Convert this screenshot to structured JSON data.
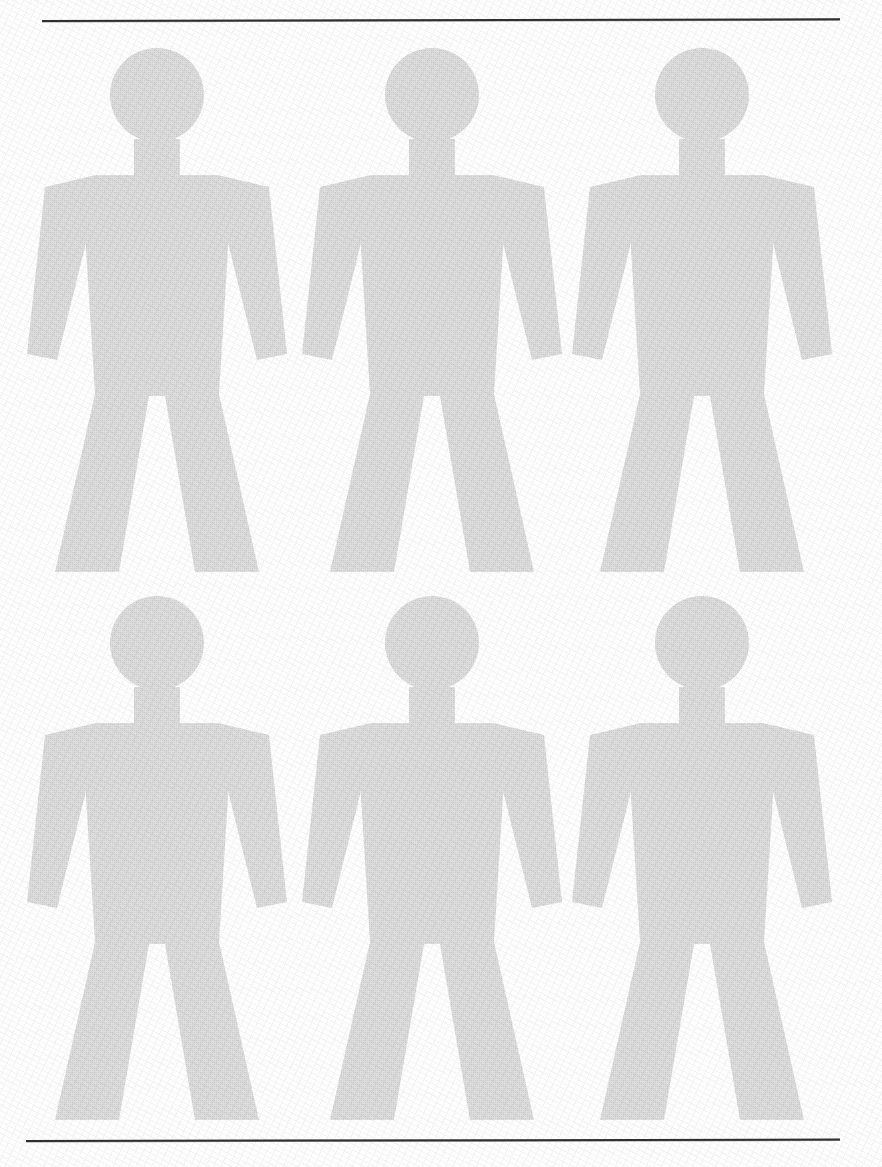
{
  "page": {
    "width": 882,
    "height": 1167,
    "background_color": "#fdfdfd",
    "figure_fill_color": "#d0d0d0",
    "rule_color": "#2f2f2f"
  },
  "rules": [
    {
      "name": "top-rule",
      "x": 42,
      "y": 20,
      "width": 798,
      "thickness": 2
    },
    {
      "name": "bottom-rule",
      "x": 26,
      "y": 1140,
      "width": 814,
      "thickness": 2
    }
  ],
  "grid": {
    "rows": 2,
    "columns": 3,
    "count": 6,
    "column_centers": [
      157,
      432,
      702
    ],
    "row_tops": [
      44,
      592
    ],
    "figure_width": 276,
    "figure_height": 528
  },
  "figures": [
    {
      "id": "figure-1",
      "label": "Human pictogram figure 1",
      "row": 1,
      "column": 1,
      "left": 19,
      "top": 44
    },
    {
      "id": "figure-2",
      "label": "Human pictogram figure 2",
      "row": 1,
      "column": 2,
      "left": 294,
      "top": 44
    },
    {
      "id": "figure-3",
      "label": "Human pictogram figure 3",
      "row": 1,
      "column": 3,
      "left": 564,
      "top": 44
    },
    {
      "id": "figure-4",
      "label": "Human pictogram figure 4",
      "row": 2,
      "column": 1,
      "left": 19,
      "top": 592
    },
    {
      "id": "figure-5",
      "label": "Human pictogram figure 5",
      "row": 2,
      "column": 2,
      "left": 294,
      "top": 592
    },
    {
      "id": "figure-6",
      "label": "Human pictogram figure 6",
      "row": 2,
      "column": 3,
      "left": 564,
      "top": 592
    }
  ],
  "pictogram": {
    "name": "standing-person-pictogram",
    "head_shape": "circle",
    "head_diameter": 94,
    "parts": [
      "head",
      "neck",
      "shoulders",
      "torso",
      "left-arm",
      "right-arm",
      "left-leg",
      "right-leg"
    ]
  }
}
